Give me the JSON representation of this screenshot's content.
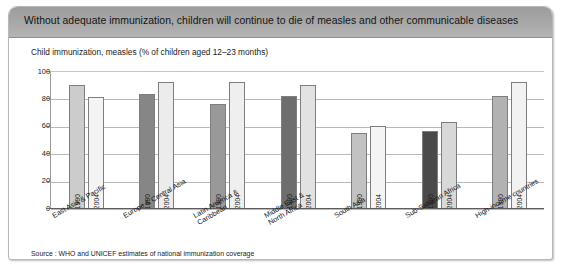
{
  "banner": {
    "title": "Without adequate immunization, children will continue to die of measles and other communicable diseases"
  },
  "source": {
    "text": "Source : WHO and UNICEF estimates of national immunization coverage"
  },
  "chart_data": {
    "type": "bar",
    "title": "Child immunization, measles (% of children aged 12–23 months)",
    "xlabel": "",
    "ylabel": "",
    "ylim": [
      0,
      100
    ],
    "yticks": [
      0,
      20,
      40,
      60,
      80,
      100
    ],
    "ytick_labels": [
      "0",
      "20",
      "40",
      "60",
      "80",
      "100"
    ],
    "grid": true,
    "legend": "none",
    "categories": [
      "East Asia & Pacific",
      "Europe & Central Asia",
      "Latin America &\nCaribbean",
      "Middle East &\nNorth Africa",
      "South Asia",
      "Sub-Saharan Africa",
      "High-income countries"
    ],
    "series": [
      {
        "name": "1990",
        "values": [
          90,
          83,
          76,
          82,
          55,
          56,
          82
        ]
      },
      {
        "name": "2004",
        "values": [
          81,
          92,
          92,
          90,
          60,
          63,
          92
        ]
      }
    ],
    "bar_colors": {
      "East Asia & Pacific": {
        "1990": "#cccccc",
        "2004": "#f4f4f4"
      },
      "Europe & Central Asia": {
        "1990": "#868686",
        "2004": "#ececec"
      },
      "Latin America &\nCaribbean": {
        "1990": "#999999",
        "2004": "#efefef"
      },
      "Middle East &\nNorth Africa": {
        "1990": "#6e6e6e",
        "2004": "#e2e2e2"
      },
      "South Asia": {
        "1990": "#c2c2c2",
        "2004": "#f4f4f4"
      },
      "Sub-Saharan Africa": {
        "1990": "#4a4a4a",
        "2004": "#d8d8d8"
      },
      "High-income countries": {
        "1990": "#b2b2b2",
        "2004": "#f2f2f2"
      }
    }
  }
}
